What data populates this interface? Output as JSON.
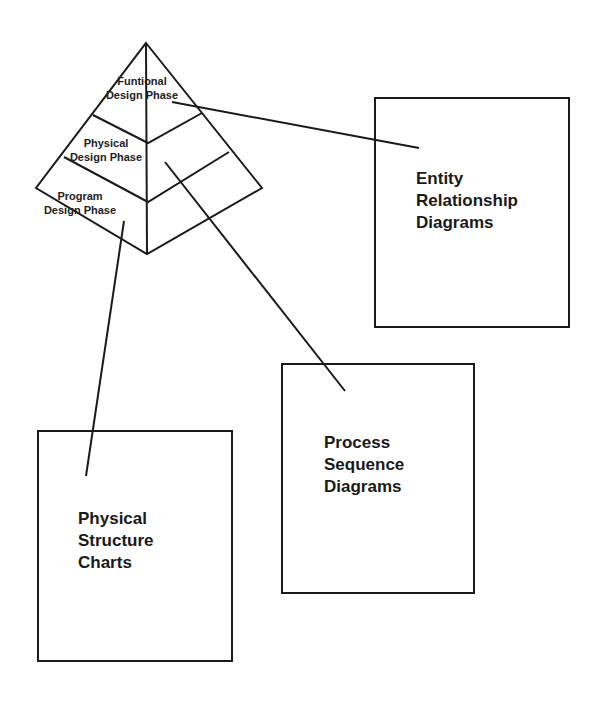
{
  "pyramid": {
    "phases": [
      {
        "label": "Funtional\nDesign Phase"
      },
      {
        "label": "Physical\nDesign Phase"
      },
      {
        "label": "Program\nDesign Phase"
      }
    ]
  },
  "boxes": [
    {
      "id": "entity",
      "label": "Entity\nRelationship\nDiagrams",
      "linked_phase": "Funtional Design Phase"
    },
    {
      "id": "process",
      "label": "Process\nSequence\nDiagrams",
      "linked_phase": "Physical Design Phase"
    },
    {
      "id": "structure",
      "label": "Physical\nStructure\nCharts",
      "linked_phase": "Program Design Phase"
    }
  ]
}
